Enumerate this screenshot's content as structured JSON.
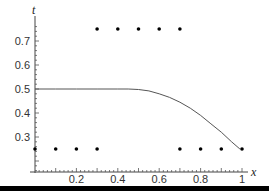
{
  "chart_data": {
    "type": "line",
    "title": "",
    "xlabel": "x",
    "ylabel": "t",
    "xlim": [
      0,
      1.03
    ],
    "ylim": [
      0.157,
      0.79
    ],
    "grid": false,
    "legend": null,
    "x_ticks": [
      0.2,
      0.4,
      0.6,
      0.8,
      1
    ],
    "x_tick_labels": [
      "0.2",
      "0.4",
      "0.6",
      "0.8",
      "1"
    ],
    "y_ticks": [
      0.3,
      0.4,
      0.5,
      0.6,
      0.7
    ],
    "y_tick_labels": [
      "0.3",
      "0.4",
      "0.5",
      "0.6",
      "0.7"
    ],
    "series": [
      {
        "name": "curve",
        "kind": "line",
        "color": "#555555",
        "x": [
          0,
          0.1,
          0.2,
          0.3,
          0.4,
          0.45,
          0.5,
          0.55,
          0.6,
          0.65,
          0.7,
          0.75,
          0.8,
          0.85,
          0.9,
          0.95,
          0.99
        ],
        "y": [
          0.5,
          0.5,
          0.5,
          0.5,
          0.5,
          0.5,
          0.498,
          0.492,
          0.48,
          0.465,
          0.445,
          0.42,
          0.39,
          0.355,
          0.32,
          0.28,
          0.25
        ]
      },
      {
        "name": "points-upper",
        "kind": "scatter",
        "color": "#000000",
        "x": [
          0.3,
          0.4,
          0.5,
          0.6,
          0.7
        ],
        "y": [
          0.75,
          0.75,
          0.75,
          0.75,
          0.75
        ]
      },
      {
        "name": "points-lower",
        "kind": "scatter",
        "color": "#000000",
        "x": [
          0,
          0.1,
          0.2,
          0.3,
          0.7,
          0.8,
          0.9,
          1.0
        ],
        "y": [
          0.25,
          0.25,
          0.25,
          0.25,
          0.25,
          0.25,
          0.25,
          0.25
        ]
      }
    ]
  }
}
